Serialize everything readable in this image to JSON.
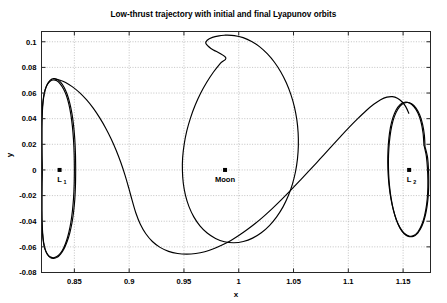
{
  "chart_data": {
    "type": "line",
    "title": "Low-thrust trajectory with initial and final Lyapunov orbits",
    "xlabel": "x",
    "ylabel": "y",
    "xlim": [
      0.82,
      1.175
    ],
    "ylim": [
      -0.08,
      0.108
    ],
    "grid": true,
    "legend": false,
    "xticks": [
      "0.85",
      "0.9",
      "0.95",
      "1",
      "1.05",
      "1.1",
      "1.15"
    ],
    "xtick_values": [
      0.85,
      0.9,
      0.95,
      1.0,
      1.05,
      1.1,
      1.15
    ],
    "yticks": [
      "0.1",
      "0.08",
      "0.06",
      "0.04",
      "0.02",
      "0",
      "-0.02",
      "-0.04",
      "-0.06",
      "-0.08"
    ],
    "ytick_values": [
      0.1,
      0.08,
      0.06,
      0.04,
      0.02,
      0,
      -0.02,
      -0.04,
      -0.06,
      -0.08
    ],
    "annotations": [
      {
        "name": "L1",
        "label": "L",
        "sublabel": "1",
        "x": 0.8365,
        "y": 0.0
      },
      {
        "name": "Moon",
        "label": "Moon",
        "sublabel": "",
        "x": 0.9875,
        "y": 0.0
      },
      {
        "name": "L2",
        "label": "L",
        "sublabel": "2",
        "x": 1.1555,
        "y": 0.0
      }
    ],
    "series": [
      {
        "name": "initial-lyapunov-orbit-L1",
        "description": "Initial Lyapunov orbit about L1",
        "closed": true,
        "points": [
          [
            0.85,
            0.0
          ],
          [
            0.8498,
            0.012
          ],
          [
            0.8492,
            0.0235
          ],
          [
            0.8482,
            0.034
          ],
          [
            0.8468,
            0.0432
          ],
          [
            0.845,
            0.0512
          ],
          [
            0.8428,
            0.0578
          ],
          [
            0.8402,
            0.063
          ],
          [
            0.8372,
            0.067
          ],
          [
            0.834,
            0.0695
          ],
          [
            0.8308,
            0.0702
          ],
          [
            0.8278,
            0.0692
          ],
          [
            0.8252,
            0.0665
          ],
          [
            0.8232,
            0.0622
          ],
          [
            0.8218,
            0.0565
          ],
          [
            0.8209,
            0.0495
          ],
          [
            0.8204,
            0.0412
          ],
          [
            0.8202,
            0.0318
          ],
          [
            0.8202,
            0.0215
          ],
          [
            0.8203,
            0.0108
          ],
          [
            0.8205,
            0.0
          ],
          [
            0.8203,
            -0.0108
          ],
          [
            0.8202,
            -0.0215
          ],
          [
            0.8202,
            -0.0318
          ],
          [
            0.8204,
            -0.0412
          ],
          [
            0.8209,
            -0.0495
          ],
          [
            0.8218,
            -0.0565
          ],
          [
            0.8232,
            -0.0618
          ],
          [
            0.8252,
            -0.0655
          ],
          [
            0.8278,
            -0.0678
          ],
          [
            0.8308,
            -0.0685
          ],
          [
            0.834,
            -0.0676
          ],
          [
            0.8372,
            -0.065
          ],
          [
            0.8402,
            -0.0608
          ],
          [
            0.8428,
            -0.0552
          ],
          [
            0.845,
            -0.0485
          ],
          [
            0.8468,
            -0.0408
          ],
          [
            0.8482,
            -0.032
          ],
          [
            0.8492,
            -0.0225
          ],
          [
            0.8498,
            -0.0118
          ],
          [
            0.85,
            0.0
          ]
        ]
      },
      {
        "name": "initial-lyapunov-orbit-L1-second-rev",
        "description": "Second revolution of initial Lyapunov orbit, slightly offset",
        "closed": true,
        "points": [
          [
            0.8512,
            0.0
          ],
          [
            0.851,
            0.012
          ],
          [
            0.8504,
            0.0238
          ],
          [
            0.8493,
            0.0345
          ],
          [
            0.8478,
            0.044
          ],
          [
            0.8458,
            0.0522
          ],
          [
            0.8434,
            0.059
          ],
          [
            0.8406,
            0.0645
          ],
          [
            0.8374,
            0.0685
          ],
          [
            0.8342,
            0.0708
          ],
          [
            0.831,
            0.0712
          ],
          [
            0.828,
            0.07
          ],
          [
            0.8254,
            0.067
          ],
          [
            0.8234,
            0.0626
          ],
          [
            0.822,
            0.0568
          ],
          [
            0.8211,
            0.0498
          ],
          [
            0.8206,
            0.0414
          ],
          [
            0.8204,
            0.032
          ],
          [
            0.8204,
            0.0216
          ],
          [
            0.8205,
            0.011
          ],
          [
            0.8207,
            0.0
          ],
          [
            0.8205,
            -0.011
          ],
          [
            0.8204,
            -0.0216
          ],
          [
            0.8204,
            -0.032
          ],
          [
            0.8206,
            -0.0414
          ],
          [
            0.8211,
            -0.0498
          ],
          [
            0.822,
            -0.0568
          ],
          [
            0.8234,
            -0.0622
          ],
          [
            0.8254,
            -0.066
          ],
          [
            0.828,
            -0.0684
          ],
          [
            0.831,
            -0.069
          ],
          [
            0.8342,
            -0.0682
          ],
          [
            0.8374,
            -0.0656
          ],
          [
            0.8406,
            -0.0614
          ],
          [
            0.8434,
            -0.0558
          ],
          [
            0.8458,
            -0.0492
          ],
          [
            0.8478,
            -0.0414
          ],
          [
            0.8493,
            -0.0326
          ],
          [
            0.8504,
            -0.0228
          ],
          [
            0.851,
            -0.012
          ],
          [
            0.8512,
            0.0
          ]
        ]
      },
      {
        "name": "transfer-arc-departure",
        "description": "Low-thrust transfer arc from L1 orbit descending across to the lower region",
        "closed": false,
        "points": [
          [
            0.833,
            0.0706
          ],
          [
            0.837,
            0.07
          ],
          [
            0.842,
            0.0682
          ],
          [
            0.848,
            0.065
          ],
          [
            0.8545,
            0.0605
          ],
          [
            0.861,
            0.0548
          ],
          [
            0.8672,
            0.0482
          ],
          [
            0.873,
            0.0408
          ],
          [
            0.8785,
            0.0328
          ],
          [
            0.8836,
            0.0242
          ],
          [
            0.8882,
            0.0152
          ],
          [
            0.8924,
            0.0058
          ],
          [
            0.8962,
            -0.004
          ],
          [
            0.8996,
            -0.014
          ],
          [
            0.9028,
            -0.024
          ],
          [
            0.9062,
            -0.0338
          ],
          [
            0.9102,
            -0.0424
          ],
          [
            0.9152,
            -0.0498
          ],
          [
            0.9212,
            -0.0558
          ],
          [
            0.9282,
            -0.0604
          ],
          [
            0.936,
            -0.0635
          ],
          [
            0.9442,
            -0.0652
          ],
          [
            0.9525,
            -0.0657
          ],
          [
            0.9608,
            -0.0652
          ],
          [
            0.969,
            -0.0638
          ],
          [
            0.977,
            -0.0615
          ],
          [
            0.9848,
            -0.0586
          ],
          [
            0.9925,
            -0.0552
          ],
          [
            1.0,
            -0.0512
          ],
          [
            1.0075,
            -0.0467
          ],
          [
            1.015,
            -0.0418
          ],
          [
            1.0228,
            -0.0362
          ],
          [
            1.0308,
            -0.03
          ],
          [
            1.039,
            -0.0232
          ],
          [
            1.0475,
            -0.0158
          ],
          [
            1.0562,
            -0.008
          ],
          [
            1.0652,
            0.0002
          ],
          [
            1.0742,
            0.0086
          ],
          [
            1.0832,
            0.017
          ],
          [
            1.092,
            0.0252
          ],
          [
            1.1005,
            0.033
          ],
          [
            1.1086,
            0.04
          ],
          [
            1.1162,
            0.0462
          ],
          [
            1.1232,
            0.0512
          ],
          [
            1.1295,
            0.0548
          ],
          [
            1.1352,
            0.0568
          ],
          [
            1.1402,
            0.0572
          ],
          [
            1.1448,
            0.056
          ],
          [
            1.149,
            0.0532
          ],
          [
            1.1525,
            0.0492
          ],
          [
            1.1552,
            0.0442
          ]
        ]
      },
      {
        "name": "large-interior-loop",
        "description": "Large egg-shaped loop around the Moon reaching the highest point of the trajectory",
        "closed": true,
        "points": [
          [
            0.988,
            0.1052
          ],
          [
            0.996,
            0.1048
          ],
          [
            1.004,
            0.1032
          ],
          [
            1.0118,
            0.1002
          ],
          [
            1.0192,
            0.096
          ],
          [
            1.0262,
            0.0905
          ],
          [
            1.0326,
            0.084
          ],
          [
            1.0384,
            0.0764
          ],
          [
            1.0434,
            0.068
          ],
          [
            1.0476,
            0.0588
          ],
          [
            1.0508,
            0.0492
          ],
          [
            1.053,
            0.0392
          ],
          [
            1.0542,
            0.029
          ],
          [
            1.0544,
            0.0188
          ],
          [
            1.0536,
            0.0086
          ],
          [
            1.0518,
            -0.0014
          ],
          [
            1.049,
            -0.011
          ],
          [
            1.0452,
            -0.0202
          ],
          [
            1.0404,
            -0.0288
          ],
          [
            1.0346,
            -0.0366
          ],
          [
            1.028,
            -0.0434
          ],
          [
            1.0206,
            -0.049
          ],
          [
            1.0126,
            -0.0532
          ],
          [
            1.0042,
            -0.0558
          ],
          [
            0.9956,
            -0.0568
          ],
          [
            0.987,
            -0.056
          ],
          [
            0.9788,
            -0.0534
          ],
          [
            0.9712,
            -0.0492
          ],
          [
            0.9646,
            -0.0436
          ],
          [
            0.959,
            -0.0366
          ],
          [
            0.9546,
            -0.0286
          ],
          [
            0.9514,
            -0.0198
          ],
          [
            0.9494,
            -0.0104
          ],
          [
            0.9486,
            -0.0006
          ],
          [
            0.9488,
            0.0096
          ],
          [
            0.9502,
            0.02
          ],
          [
            0.9526,
            0.0304
          ],
          [
            0.956,
            0.0406
          ],
          [
            0.9602,
            0.0504
          ],
          [
            0.9652,
            0.0598
          ],
          [
            0.9708,
            0.0684
          ],
          [
            0.9768,
            0.0762
          ],
          [
            0.9832,
            0.0832
          ],
          [
            0.988,
            0.0878
          ],
          [
            0.9746,
            0.0948
          ],
          [
            0.97,
            0.0986
          ],
          [
            0.9712,
            0.1012
          ],
          [
            0.976,
            0.1034
          ],
          [
            0.982,
            0.1046
          ],
          [
            0.988,
            0.1052
          ]
        ]
      },
      {
        "name": "final-lyapunov-orbit-L2",
        "description": "Final Lyapunov orbit about L2, tilted ellipse",
        "closed": true,
        "points": [
          [
            1.17,
            0.018
          ],
          [
            1.1694,
            0.0272
          ],
          [
            1.1678,
            0.0356
          ],
          [
            1.1652,
            0.0428
          ],
          [
            1.1618,
            0.0482
          ],
          [
            1.1578,
            0.0516
          ],
          [
            1.1534,
            0.0526
          ],
          [
            1.149,
            0.0512
          ],
          [
            1.1452,
            0.0474
          ],
          [
            1.142,
            0.0416
          ],
          [
            1.1396,
            0.0342
          ],
          [
            1.138,
            0.0258
          ],
          [
            1.137,
            0.0166
          ],
          [
            1.1366,
            0.007
          ],
          [
            1.1368,
            -0.0028
          ],
          [
            1.1376,
            -0.0124
          ],
          [
            1.139,
            -0.0218
          ],
          [
            1.141,
            -0.0306
          ],
          [
            1.1436,
            -0.0384
          ],
          [
            1.1468,
            -0.0448
          ],
          [
            1.1506,
            -0.0494
          ],
          [
            1.1548,
            -0.0518
          ],
          [
            1.1592,
            -0.0518
          ],
          [
            1.1634,
            -0.0492
          ],
          [
            1.167,
            -0.0442
          ],
          [
            1.1698,
            -0.0372
          ],
          [
            1.1718,
            -0.0288
          ],
          [
            1.173,
            -0.0196
          ],
          [
            1.1734,
            -0.01
          ],
          [
            1.1732,
            -0.0002
          ],
          [
            1.1724,
            0.0092
          ],
          [
            1.1712,
            0.0142
          ],
          [
            1.17,
            0.018
          ]
        ]
      },
      {
        "name": "final-lyapunov-orbit-L2-second-rev",
        "description": "Second revolution of final Lyapunov orbit about L2",
        "closed": true,
        "points": [
          [
            1.169,
            0.0196
          ],
          [
            1.1682,
            0.0288
          ],
          [
            1.1664,
            0.0372
          ],
          [
            1.1636,
            0.0442
          ],
          [
            1.16,
            0.0492
          ],
          [
            1.1558,
            0.0522
          ],
          [
            1.1514,
            0.0528
          ],
          [
            1.1472,
            0.051
          ],
          [
            1.1436,
            0.0468
          ],
          [
            1.1406,
            0.0406
          ],
          [
            1.1384,
            0.033
          ],
          [
            1.137,
            0.0244
          ],
          [
            1.1362,
            0.0152
          ],
          [
            1.136,
            0.0056
          ],
          [
            1.1364,
            -0.0042
          ],
          [
            1.1374,
            -0.0138
          ],
          [
            1.139,
            -0.023
          ],
          [
            1.1412,
            -0.0316
          ],
          [
            1.144,
            -0.0392
          ],
          [
            1.1474,
            -0.0454
          ],
          [
            1.1512,
            -0.0496
          ],
          [
            1.1554,
            -0.0516
          ],
          [
            1.1596,
            -0.0512
          ],
          [
            1.1636,
            -0.0482
          ],
          [
            1.167,
            -0.0428
          ],
          [
            1.1696,
            -0.0356
          ],
          [
            1.1714,
            -0.0272
          ],
          [
            1.1724,
            -0.018
          ],
          [
            1.1726,
            -0.0084
          ],
          [
            1.1722,
            0.0014
          ],
          [
            1.1712,
            0.0108
          ],
          [
            1.17,
            0.0158
          ],
          [
            1.169,
            0.0196
          ]
        ]
      }
    ]
  },
  "axes": {
    "title": "Low-thrust trajectory with initial and final Lyapunov orbits",
    "x_axis_label": "x",
    "y_axis_label": "y"
  }
}
